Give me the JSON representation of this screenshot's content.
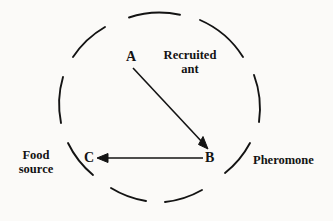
{
  "figure": {
    "background_color": "#fbfaf8",
    "ink_color": "#131313"
  },
  "nodes": [
    {
      "id": "a",
      "label": "A",
      "x": 133,
      "y": 57
    },
    {
      "id": "b",
      "label": "B",
      "x": 211,
      "y": 158
    },
    {
      "id": "c",
      "label": "C",
      "x": 90,
      "y": 158
    }
  ],
  "annotations": [
    {
      "id": "recruited-ant",
      "line1": "Recruited",
      "line2": "ant",
      "text": "Recruited ant"
    },
    {
      "id": "pheromone",
      "text": "Pheromone"
    },
    {
      "id": "food-source",
      "line1": "Food",
      "line2": "source",
      "text": "Food source"
    }
  ],
  "arrows": [
    {
      "id": "a-to-b",
      "from": "A",
      "to": "B",
      "direction": "down-right"
    },
    {
      "id": "b-to-c",
      "from": "B",
      "to": "C",
      "direction": "left"
    }
  ],
  "circle": {
    "style": "dashed",
    "center_x": 166,
    "center_y": 110,
    "radius": 96,
    "segment_count": 8
  }
}
